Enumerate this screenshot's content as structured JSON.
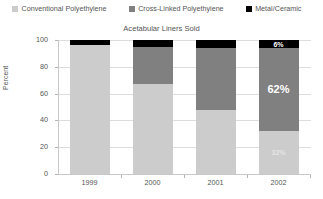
{
  "chart_data": {
    "type": "bar",
    "subtype": "stacked-percent-column",
    "title": "Acetabular Liners Sold",
    "xlabel": "",
    "ylabel": "Percent",
    "categories": [
      "1999",
      "2000",
      "2001",
      "2002"
    ],
    "ylim": [
      0,
      100
    ],
    "yticks": [
      0,
      20,
      40,
      60,
      80,
      100
    ],
    "grid": true,
    "legend_position": "top",
    "series": [
      {
        "name": "Conventional Polyethylene",
        "color": "#cccccc",
        "values": [
          96,
          67,
          48,
          32
        ]
      },
      {
        "name": "Cross-Linked Polyethylene",
        "color": "#808080",
        "values": [
          0,
          28,
          46,
          62
        ]
      },
      {
        "name": "Metal/Ceramic",
        "color": "#000000",
        "values": [
          4,
          5,
          6,
          6
        ]
      }
    ],
    "annotations": [
      {
        "category": "2002",
        "series": "Metal/Ceramic",
        "text": "6%"
      },
      {
        "category": "2002",
        "series": "Cross-Linked Polyethylene",
        "text": "62%"
      },
      {
        "category": "2002",
        "series": "Conventional Polyethylene",
        "text": "32%"
      }
    ]
  },
  "legend": {
    "items": [
      {
        "label": "Conventional Polyethylene",
        "color": "#cccccc"
      },
      {
        "label": "Cross-Linked Polyethylene",
        "color": "#808080"
      },
      {
        "label": "Metal/Ceramic",
        "color": "#000000"
      }
    ]
  },
  "axes": {
    "y_title": "Percent",
    "y_ticks": [
      "100",
      "80",
      "60",
      "40",
      "20",
      "0"
    ],
    "x_ticks": [
      "1999",
      "2000",
      "2001",
      "2002"
    ]
  }
}
